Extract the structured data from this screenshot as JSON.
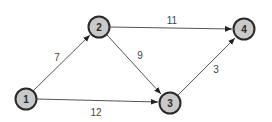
{
  "diagram": {
    "type": "directed-weighted-graph",
    "colors": {
      "node_fill": "#c9c9c9",
      "node_stroke": "#2a2a2a",
      "edge": "#555555",
      "label": "#444444"
    },
    "nodes": [
      {
        "id": "1",
        "label": "1",
        "x": 26,
        "y": 99
      },
      {
        "id": "2",
        "label": "2",
        "x": 99,
        "y": 27
      },
      {
        "id": "3",
        "label": "3",
        "x": 170,
        "y": 103
      },
      {
        "id": "4",
        "label": "4",
        "x": 244,
        "y": 29
      }
    ],
    "edges": [
      {
        "from": "1",
        "to": "2",
        "weight": "7",
        "label_x": 57,
        "label_y": 57
      },
      {
        "from": "2",
        "to": "4",
        "weight": "11",
        "label_x": 172,
        "label_y": 20
      },
      {
        "from": "2",
        "to": "3",
        "weight": "9",
        "label_x": 140,
        "label_y": 55
      },
      {
        "from": "1",
        "to": "3",
        "weight": "12",
        "label_x": 96,
        "label_y": 112
      },
      {
        "from": "3",
        "to": "4",
        "weight": "3",
        "label_x": 216,
        "label_y": 69
      }
    ]
  }
}
